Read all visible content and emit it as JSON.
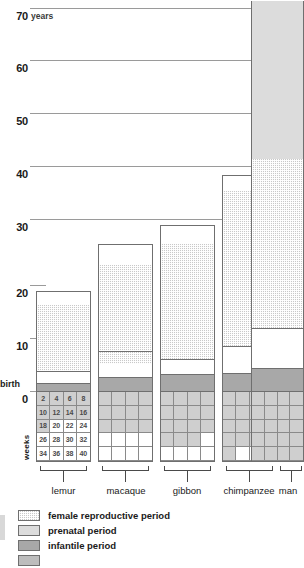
{
  "chart_data": {
    "type": "bar",
    "title": "",
    "xlabel": "",
    "ylabel": "years",
    "ylim": [
      0,
      73
    ],
    "grid": true,
    "legend_position": "bottom-left",
    "y_unit": "years",
    "y_ticks": [
      {
        "label": "70",
        "value": 70
      },
      {
        "label": "60",
        "value": 60
      },
      {
        "label": "50",
        "value": 50
      },
      {
        "label": "40",
        "value": 40
      },
      {
        "label": "30",
        "value": 30
      },
      {
        "label": "20",
        "value": 20
      },
      {
        "label": "10",
        "value": 10
      },
      {
        "label": "0",
        "value": 0
      }
    ],
    "birth_label": "birth",
    "weeks_label": "weeks",
    "categories": [
      "lemur",
      "macaque",
      "gibbon",
      "chimpanzee",
      "man"
    ],
    "series": [
      {
        "name": "infantile period",
        "values": [
          1.2,
          2.3,
          2.6,
          3.1,
          4.0
        ]
      },
      {
        "name": "juvenile period",
        "values": [
          2.3,
          5.0,
          6.4,
          7.9,
          11.0
        ]
      },
      {
        "name": "female reproductive period",
        "values": [
          15.5,
          20.7,
          22.5,
          30.0,
          58.0
        ]
      }
    ],
    "lifespan_total_years": [
      19.0,
      28.0,
      31.5,
      41.0,
      73.0
    ],
    "gestation_weeks": [
      18,
      24,
      30,
      34,
      40
    ],
    "gestation_note": "prenatal period shown below the baseline as a grid of weeks; shaded cells indicate gestation length",
    "weeks_grid_numbers": [
      [
        "2",
        "4",
        "6",
        "8"
      ],
      [
        "10",
        "12",
        "14",
        "16"
      ],
      [
        "18",
        "20",
        "22",
        "24"
      ],
      [
        "26",
        "28",
        "30",
        "32"
      ],
      [
        "34",
        "36",
        "38",
        "40"
      ]
    ],
    "annotations": []
  },
  "legend": {
    "items": [
      {
        "label": "female reproductive period",
        "pattern": "stipple",
        "color": "#c9c9c9"
      },
      {
        "label": "prenatal period",
        "pattern": "solid-light",
        "color": "#dcdcdc"
      },
      {
        "label": "infantile period",
        "pattern": "solid-gray",
        "color": "#a8a8a8"
      },
      {
        "label": "",
        "pattern": "solid",
        "color": "#bdbdbd"
      }
    ]
  },
  "colors": {
    "reproductive": "#c9c9c9",
    "prenatal": "#dcdcdc",
    "infantile": "#a8a8a8",
    "juvenile": "#ffffff",
    "gridline": "#9a9a9a",
    "outline": "#6f6f6f",
    "text": "#1a1a1a"
  }
}
